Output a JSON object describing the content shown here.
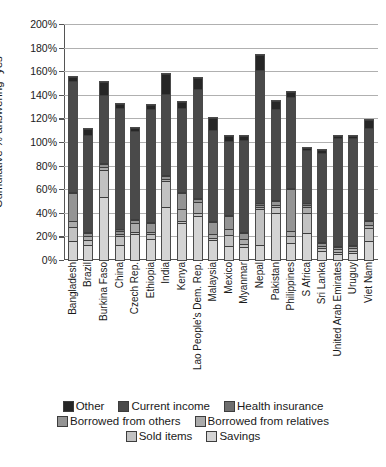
{
  "chart_data": {
    "type": "bar",
    "stacked": true,
    "title": "",
    "xlabel": "",
    "ylabel": "Cumulative % answering \"yes\"",
    "ylim": [
      0,
      200
    ],
    "yticks": [
      "0%",
      "20%",
      "40%",
      "60%",
      "80%",
      "100%",
      "120%",
      "140%",
      "160%",
      "180%",
      "200%"
    ],
    "ytick_values": [
      0,
      20,
      40,
      60,
      80,
      100,
      120,
      140,
      160,
      180,
      200
    ],
    "grid": true,
    "legend_position": "bottom",
    "categories": [
      "Bangladesh",
      "Brazil",
      "Burkina Faso",
      "China",
      "Czech Rep.",
      "Ethiopia",
      "India",
      "Kenya",
      "Lao People's Dem. Rep.",
      "Malaysia",
      "Mexico",
      "Myanmar",
      "Nepal",
      "Pakistan",
      "Philippines",
      "S Africa",
      "Sri Lanka",
      "United Arab Emirates",
      "Uruguy",
      "Viet Nam"
    ],
    "series": [
      {
        "name": "Savings",
        "color": "#d4d4d4",
        "values": [
          16,
          13,
          53,
          13,
          22,
          18,
          45,
          31,
          37,
          17,
          12,
          11,
          13,
          40,
          14,
          23,
          8,
          5,
          6,
          16
        ]
      },
      {
        "name": "Sold items",
        "color": "#c2c2c2",
        "values": [
          12,
          4,
          23,
          7,
          2,
          4,
          22,
          2,
          3,
          2,
          9,
          3,
          30,
          5,
          6,
          17,
          2,
          2,
          2,
          11
        ]
      },
      {
        "name": "Borrowed from relatives",
        "color": "#ababab",
        "values": [
          5,
          3,
          3,
          2,
          7,
          2,
          2,
          10,
          9,
          3,
          5,
          4,
          2,
          2,
          5,
          5,
          2,
          2,
          2,
          3
        ]
      },
      {
        "name": "Borrowed from others",
        "color": "#949494",
        "values": [
          24,
          3,
          2,
          3,
          3,
          7,
          2,
          14,
          3,
          10,
          11,
          5,
          2,
          3,
          35,
          2,
          2,
          2,
          2,
          3
        ]
      },
      {
        "name": "Health insurance",
        "color": "#6e6e6e",
        "values": [
          1,
          1,
          1,
          1,
          1,
          1,
          1,
          1,
          1,
          1,
          1,
          1,
          1,
          1,
          1,
          1,
          1,
          1,
          1,
          1
        ]
      },
      {
        "name": "Current income",
        "color": "#4a4a4a",
        "values": [
          94,
          82,
          58,
          103,
          74,
          96,
          69,
          71,
          92,
          77,
          63,
          78,
          113,
          77,
          77,
          45,
          76,
          91,
          90,
          78
        ]
      },
      {
        "name": "Other",
        "color": "#262626",
        "values": [
          3,
          5,
          11,
          3,
          3,
          3,
          17,
          5,
          9,
          10,
          4,
          3,
          13,
          7,
          4,
          2,
          2,
          2,
          2,
          7
        ]
      }
    ],
    "totals": [
      155,
      111,
      151,
      132,
      112,
      131,
      158,
      134,
      154,
      120,
      105,
      105,
      174,
      135,
      142,
      95,
      93,
      105,
      105,
      119
    ]
  },
  "legend": {
    "rows": [
      [
        {
          "label": "Other",
          "color": "#262626",
          "icon": "legend-swatch"
        },
        {
          "label": "Current income",
          "color": "#4a4a4a",
          "icon": "legend-swatch"
        },
        {
          "label": "Health insurance",
          "color": "#6e6e6e",
          "icon": "legend-swatch"
        }
      ],
      [
        {
          "label": "Borrowed from others",
          "color": "#949494",
          "icon": "legend-swatch"
        },
        {
          "label": "Borrowed from relatives",
          "color": "#ababab",
          "icon": "legend-swatch"
        }
      ],
      [
        {
          "label": "Sold items",
          "color": "#c2c2c2",
          "icon": "legend-swatch"
        },
        {
          "label": "Savings",
          "color": "#d4d4d4",
          "icon": "legend-swatch"
        }
      ]
    ]
  }
}
